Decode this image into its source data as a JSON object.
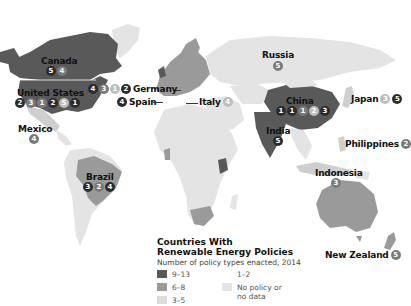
{
  "legend": {
    "title_line1": "Countries With",
    "title_line2": "Renewable Energy Policies",
    "subtitle": "Number of policy types enacted, 2014",
    "items": [
      {
        "label": "9–13",
        "color": "#595959"
      },
      {
        "label": "6–8",
        "color": "#9a9a9a"
      },
      {
        "label": "3–5",
        "color": "#cfcfcf"
      },
      {
        "label": "1–2",
        "color": "#ffffff"
      },
      {
        "label": "No policy or no data",
        "line1": "No policy or",
        "line2": "no data",
        "color": "#e4e4e4"
      }
    ]
  },
  "countries": {
    "canada": {
      "name": "Canada",
      "badges": [
        {
          "v": "5",
          "t": "dark"
        },
        {
          "v": "4",
          "t": "mid"
        }
      ]
    },
    "united_states": {
      "name": "United States",
      "badges": [
        {
          "v": "2",
          "t": "dark"
        },
        {
          "v": "3",
          "t": "mid"
        },
        {
          "v": "1",
          "t": "mid"
        },
        {
          "v": "2",
          "t": "dark"
        },
        {
          "v": "5",
          "t": "light"
        },
        {
          "v": "1",
          "t": "dark"
        }
      ]
    },
    "mexico": {
      "name": "Mexico",
      "badges": [
        {
          "v": "4",
          "t": "mid"
        }
      ]
    },
    "germany": {
      "name": "Germany",
      "badges": [
        {
          "v": "4",
          "t": "dark"
        },
        {
          "v": "3",
          "t": "mid"
        },
        {
          "v": "1",
          "t": "light"
        },
        {
          "v": "2",
          "t": "dark"
        }
      ]
    },
    "spain": {
      "name": "Spain",
      "badges": [
        {
          "v": "4",
          "t": "dark"
        }
      ]
    },
    "italy": {
      "name": "Italy",
      "badges": [
        {
          "v": "4",
          "t": "light"
        }
      ]
    },
    "russia": {
      "name": "Russia",
      "badges": [
        {
          "v": "5",
          "t": "mid"
        }
      ]
    },
    "china": {
      "name": "China",
      "badges": [
        {
          "v": "1",
          "t": "dark"
        },
        {
          "v": "1",
          "t": "dark"
        },
        {
          "v": "1",
          "t": "mid"
        },
        {
          "v": "2",
          "t": "light"
        },
        {
          "v": "3",
          "t": "dark"
        }
      ]
    },
    "india": {
      "name": "India",
      "badges": [
        {
          "v": "5",
          "t": "dark"
        }
      ]
    },
    "japan": {
      "name": "Japan",
      "badges": [
        {
          "v": "3",
          "t": "light"
        },
        {
          "v": "5",
          "t": "dark"
        }
      ]
    },
    "philippines": {
      "name": "Philippines",
      "badges": [
        {
          "v": "2",
          "t": "mid"
        }
      ]
    },
    "indonesia": {
      "name": "Indonesia",
      "badges": [
        {
          "v": "3",
          "t": "mid"
        }
      ]
    },
    "brazil": {
      "name": "Brazil",
      "badges": [
        {
          "v": "3",
          "t": "dark"
        },
        {
          "v": "2",
          "t": "mid"
        },
        {
          "v": "4",
          "t": "dark"
        }
      ]
    },
    "new_zealand": {
      "name": "New Zealand",
      "badges": [
        {
          "v": "5",
          "t": "mid"
        }
      ]
    }
  },
  "colors": {
    "dark_fill": "#595959",
    "mid_fill": "#9a9a9a",
    "light_fill": "#cfcfcf",
    "nodata_fill": "#e4e4e4",
    "badge_dark": "#2b2b2b",
    "badge_mid": "#7a7a7a",
    "badge_light": "#bdbdbd"
  }
}
